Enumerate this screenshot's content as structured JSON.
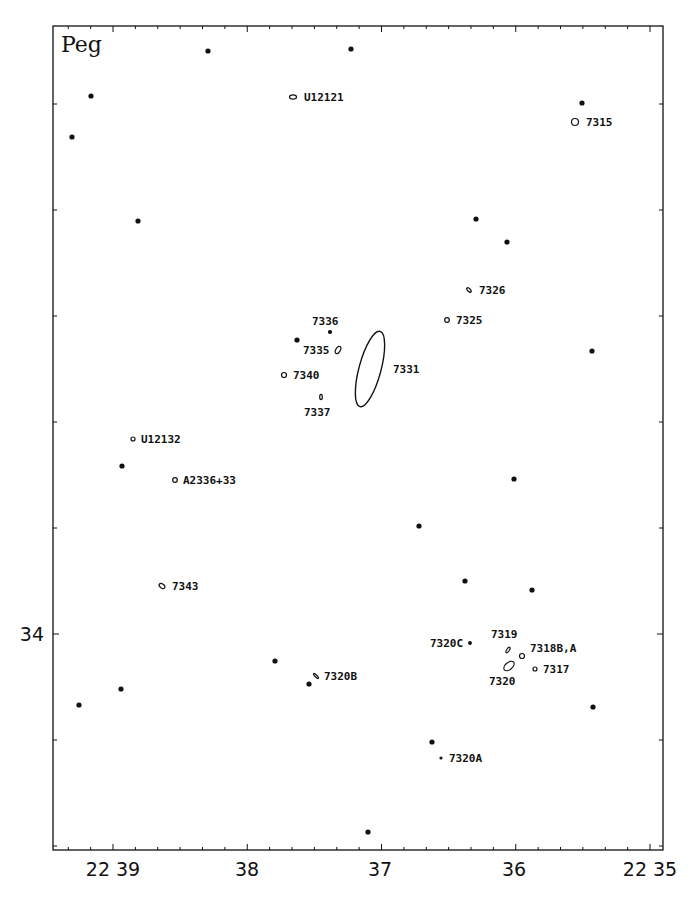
{
  "chart_data": {
    "type": "scatter",
    "title": "Peg",
    "constellation_label": "Peg",
    "xlabel": "Right Ascension (22h, minutes)",
    "ylabel": "Declination",
    "x_ticks": [
      {
        "label": "22 39",
        "px": 113
      },
      {
        "label": "38",
        "px": 247
      },
      {
        "label": "37",
        "px": 380
      },
      {
        "label": "36",
        "px": 514
      },
      {
        "label": "22 35",
        "px": 650
      }
    ],
    "y_ticks": [
      {
        "label": "34",
        "px": 634
      }
    ],
    "grid": false,
    "frame": {
      "left": 53,
      "top": 26,
      "right": 663,
      "bottom": 850
    },
    "stars": [
      {
        "x": 208,
        "y": 51
      },
      {
        "x": 351,
        "y": 49
      },
      {
        "x": 91,
        "y": 96
      },
      {
        "x": 582,
        "y": 103
      },
      {
        "x": 72,
        "y": 137
      },
      {
        "x": 138,
        "y": 221
      },
      {
        "x": 476,
        "y": 219
      },
      {
        "x": 507,
        "y": 242
      },
      {
        "x": 297,
        "y": 340
      },
      {
        "x": 592,
        "y": 351
      },
      {
        "x": 122,
        "y": 466
      },
      {
        "x": 514,
        "y": 479
      },
      {
        "x": 419,
        "y": 526
      },
      {
        "x": 465,
        "y": 581
      },
      {
        "x": 532,
        "y": 590
      },
      {
        "x": 275,
        "y": 661
      },
      {
        "x": 309,
        "y": 684
      },
      {
        "x": 121,
        "y": 689
      },
      {
        "x": 79,
        "y": 705
      },
      {
        "x": 593,
        "y": 707
      },
      {
        "x": 432,
        "y": 742
      },
      {
        "x": 368,
        "y": 832
      }
    ],
    "galaxies": [
      {
        "name": "U12121",
        "x": 293,
        "y": 97,
        "rx": 3.5,
        "ry": 2.2,
        "angle": 0,
        "lx": 304,
        "ly": 101
      },
      {
        "name": "7315",
        "x": 575,
        "y": 122,
        "rx": 3.5,
        "ry": 3.5,
        "angle": 0,
        "lx": 586,
        "ly": 126
      },
      {
        "name": "7326",
        "x": 469,
        "y": 290,
        "rx": 2.8,
        "ry": 1.4,
        "angle": 45,
        "lx": 479,
        "ly": 294
      },
      {
        "name": "7325",
        "x": 447,
        "y": 320,
        "rx": 2.3,
        "ry": 2.3,
        "angle": 0,
        "lx": 456,
        "ly": 324
      },
      {
        "name": "7336",
        "x": 330,
        "y": 332,
        "rx": 1.5,
        "ry": 1.5,
        "angle": 0,
        "lx": 312,
        "ly": 325
      },
      {
        "name": "7335",
        "x": 338,
        "y": 350,
        "rx": 2.2,
        "ry": 4,
        "angle": 30,
        "lx": 303,
        "ly": 354
      },
      {
        "name": "7331",
        "x": 370,
        "y": 369,
        "rx": 11,
        "ry": 39,
        "angle": 15,
        "lx": 393,
        "ly": 373
      },
      {
        "name": "7340",
        "x": 284,
        "y": 375,
        "rx": 2.5,
        "ry": 2.5,
        "angle": 0,
        "lx": 293,
        "ly": 379
      },
      {
        "name": "7337",
        "x": 321,
        "y": 397,
        "rx": 1.3,
        "ry": 2.6,
        "angle": 0,
        "lx": 304,
        "ly": 416
      },
      {
        "name": "U12132",
        "x": 133,
        "y": 439,
        "rx": 2,
        "ry": 2,
        "angle": 0,
        "lx": 141,
        "ly": 443
      },
      {
        "name": "A2336+33",
        "x": 175,
        "y": 480,
        "rx": 2.3,
        "ry": 2.3,
        "angle": 0,
        "lx": 183,
        "ly": 484
      },
      {
        "name": "7343",
        "x": 162,
        "y": 586,
        "rx": 3.2,
        "ry": 2,
        "angle": 35,
        "lx": 172,
        "ly": 590
      },
      {
        "name": "7320C",
        "x": 470,
        "y": 643,
        "rx": 1.3,
        "ry": 1.3,
        "angle": 0,
        "lx": 430,
        "ly": 647
      },
      {
        "name": "7319",
        "x": 508,
        "y": 650,
        "rx": 1.3,
        "ry": 3.2,
        "angle": 35,
        "lx": 491,
        "ly": 638
      },
      {
        "name": "7318B,A",
        "x": 522,
        "y": 656,
        "rx": 2.5,
        "ry": 2.5,
        "angle": 0,
        "lx": 530,
        "ly": 652
      },
      {
        "name": "7320",
        "x": 509,
        "y": 666,
        "rx": 3.5,
        "ry": 6,
        "angle": 50,
        "lx": 489,
        "ly": 685
      },
      {
        "name": "7317",
        "x": 535,
        "y": 669,
        "rx": 2,
        "ry": 2,
        "angle": 0,
        "lx": 543,
        "ly": 673
      },
      {
        "name": "7320B",
        "x": 316,
        "y": 676,
        "rx": 1,
        "ry": 3.4,
        "angle": -45,
        "lx": 324,
        "ly": 680
      },
      {
        "name": "7320A",
        "x": 441,
        "y": 758,
        "rx": 1,
        "ry": 1,
        "angle": 0,
        "lx": 449,
        "ly": 762
      }
    ]
  }
}
